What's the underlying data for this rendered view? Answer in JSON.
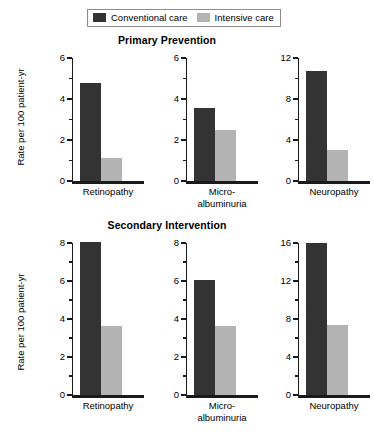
{
  "legend": {
    "entries": [
      {
        "label": "Conventional care",
        "color": "#333333",
        "swatch_name": "legend-swatch-conventional"
      },
      {
        "label": "Intensive care",
        "color": "#b3b3b3",
        "swatch_name": "legend-swatch-intensive"
      }
    ]
  },
  "axis": {
    "ylabel": "Rate per 100 patient-yr"
  },
  "sections": [
    {
      "id": "primary",
      "title": "Primary Prevention"
    },
    {
      "id": "secondary",
      "title": "Secondary Intervention"
    }
  ],
  "panels": {
    "primary": [
      {
        "category": "Retinopathy",
        "category_lines": [
          "Retinopathy"
        ],
        "ylim": 6,
        "ticks": [
          0,
          2,
          4,
          6
        ],
        "minor_ticks": [
          1,
          3,
          5
        ],
        "conventional": 4.8,
        "intensive": 1.1
      },
      {
        "category": "Micro-albuminuria",
        "category_lines": [
          "Micro-",
          "albuminuria"
        ],
        "ylim": 6,
        "ticks": [
          0,
          2,
          4,
          6
        ],
        "minor_ticks": [
          1,
          3,
          5
        ],
        "conventional": 3.55,
        "intensive": 2.5
      },
      {
        "category": "Neuropathy",
        "category_lines": [
          "Neuropathy"
        ],
        "ylim": 12,
        "ticks": [
          0,
          4,
          8,
          12
        ],
        "minor_ticks": [
          2,
          6,
          10
        ],
        "conventional": 10.7,
        "intensive": 3.0
      }
    ],
    "secondary": [
      {
        "category": "Retinopathy",
        "category_lines": [
          "Retinopathy"
        ],
        "ylim": 8,
        "ticks": [
          0,
          2,
          4,
          6,
          8
        ],
        "minor_ticks": [
          1,
          3,
          5,
          7
        ],
        "conventional": 8.05,
        "intensive": 3.65
      },
      {
        "category": "Micro-albuminuria",
        "category_lines": [
          "Micro-",
          "albuminuria"
        ],
        "ylim": 8,
        "ticks": [
          0,
          2,
          4,
          6,
          8
        ],
        "minor_ticks": [
          1,
          3,
          5,
          7
        ],
        "conventional": 6.05,
        "intensive": 3.65
      },
      {
        "category": "Neuropathy",
        "category_lines": [
          "Neuropathy"
        ],
        "ylim": 16,
        "ticks": [
          0,
          4,
          8,
          12,
          16
        ],
        "minor_ticks": [
          2,
          6,
          10,
          14
        ],
        "conventional": 16.0,
        "intensive": 7.4
      }
    ]
  },
  "chart_data": {
    "type": "bar",
    "title": "",
    "xlabel": "",
    "ylabel": "Rate per 100 patient-yr",
    "grid": false,
    "legend_position": "top-center",
    "categories": [
      "Retinopathy",
      "Micro-albuminuria",
      "Neuropathy"
    ],
    "panels": [
      {
        "title": "Primary Prevention",
        "subplots": [
          {
            "category": "Retinopathy",
            "ylim": [
              0,
              6
            ],
            "yticks": [
              0,
              2,
              4,
              6
            ],
            "series": [
              {
                "name": "Conventional care",
                "value": 4.8
              },
              {
                "name": "Intensive care",
                "value": 1.1
              }
            ]
          },
          {
            "category": "Micro-albuminuria",
            "ylim": [
              0,
              6
            ],
            "yticks": [
              0,
              2,
              4,
              6
            ],
            "series": [
              {
                "name": "Conventional care",
                "value": 3.55
              },
              {
                "name": "Intensive care",
                "value": 2.5
              }
            ]
          },
          {
            "category": "Neuropathy",
            "ylim": [
              0,
              12
            ],
            "yticks": [
              0,
              4,
              8,
              12
            ],
            "series": [
              {
                "name": "Conventional care",
                "value": 10.7
              },
              {
                "name": "Intensive care",
                "value": 3.0
              }
            ]
          }
        ]
      },
      {
        "title": "Secondary Intervention",
        "subplots": [
          {
            "category": "Retinopathy",
            "ylim": [
              0,
              8
            ],
            "yticks": [
              0,
              2,
              4,
              6,
              8
            ],
            "series": [
              {
                "name": "Conventional care",
                "value": 8.05
              },
              {
                "name": "Intensive care",
                "value": 3.65
              }
            ]
          },
          {
            "category": "Micro-albuminuria",
            "ylim": [
              0,
              8
            ],
            "yticks": [
              0,
              2,
              4,
              6,
              8
            ],
            "series": [
              {
                "name": "Conventional care",
                "value": 6.05
              },
              {
                "name": "Intensive care",
                "value": 3.65
              }
            ]
          },
          {
            "category": "Neuropathy",
            "ylim": [
              0,
              16
            ],
            "yticks": [
              0,
              4,
              8,
              12,
              16
            ],
            "series": [
              {
                "name": "Conventional care",
                "value": 16.0
              },
              {
                "name": "Intensive care",
                "value": 7.4
              }
            ]
          }
        ]
      }
    ],
    "series_colors": {
      "Conventional care": "#333333",
      "Intensive care": "#b3b3b3"
    }
  }
}
